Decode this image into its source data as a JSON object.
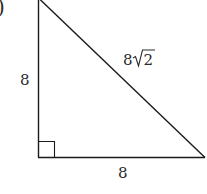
{
  "figure": {
    "option_label_fragment": ")",
    "shape": "right triangle",
    "right_angle_marker": true,
    "labels": {
      "vertical_leg": "8",
      "horizontal_leg": "8",
      "hypotenuse_coefficient": "8",
      "hypotenuse_radicand": "2"
    },
    "colors": {
      "stroke": "#1a1a1a",
      "text": "#2a2a2a",
      "background": "#ffffff"
    }
  }
}
